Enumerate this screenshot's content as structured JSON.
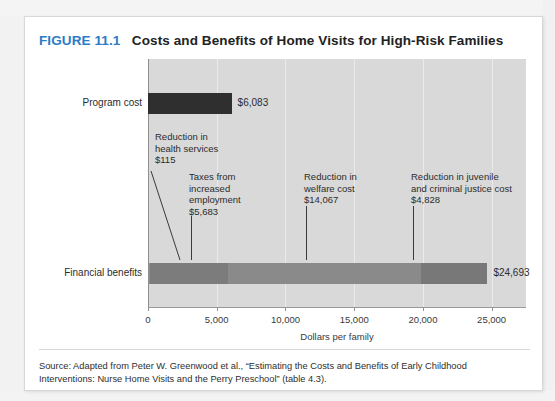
{
  "figure": {
    "number_label": "FIGURE 11.1",
    "title": "Costs and Benefits of Home Visits for High-Risk Families",
    "number_color": "#2b7cc4",
    "title_color": "#222222"
  },
  "source_note": "Source: Adapted from Peter W. Greenwood et al., “Estimating the Costs and Benefits of Early Childhood Interventions: Nurse Home Visits and the Perry Preschool” (table 4.3).",
  "chart_data": {
    "type": "bar",
    "orientation": "horizontal",
    "stacked": true,
    "title": "Costs and Benefits of Home Visits for High-Risk Families",
    "xlabel": "Dollars per family",
    "ylabel": "",
    "xlim": [
      0,
      27500
    ],
    "xticks": [
      0,
      5000,
      10000,
      15000,
      20000,
      25000
    ],
    "xtick_labels": [
      "0",
      "5,000",
      "10,000",
      "15,000",
      "20,000",
      "25,000"
    ],
    "grid": true,
    "legend": false,
    "categories": [
      "Program cost",
      "Financial benefits"
    ],
    "bars": [
      {
        "category": "Program cost",
        "total": 6083,
        "total_label": "$6,083",
        "segments": [
          {
            "name": "Program cost",
            "value": 6083,
            "color": "#2f2f2f"
          }
        ]
      },
      {
        "category": "Financial benefits",
        "total": 24693,
        "total_label": "$24,693",
        "segments": [
          {
            "name": "Reduction in health services",
            "value": 115,
            "color": "#8e8e8e"
          },
          {
            "name": "Taxes from increased employment",
            "value": 5683,
            "color": "#7c7c7c"
          },
          {
            "name": "Reduction in welfare cost",
            "value": 14067,
            "color": "#8a8a8a"
          },
          {
            "name": "Reduction in juvenile and criminal justice cost",
            "value": 4828,
            "color": "#787878"
          }
        ]
      }
    ],
    "annotations": [
      {
        "text": "Reduction in\nhealth services\n$115",
        "value_label": "$115",
        "points_to": 115
      },
      {
        "text": "Taxes from\nincreased\nemployment\n$5,683",
        "value_label": "$5,683",
        "points_to": 2900
      },
      {
        "text": "Reduction in\nwelfare cost\n$14,067",
        "value_label": "$14,067",
        "points_to": 12700
      },
      {
        "text": "Reduction in juvenile\nand criminal justice cost\n$4,828",
        "value_label": "$4,828",
        "points_to": 21500
      }
    ]
  },
  "axis": {
    "tick_labels": [
      "0",
      "5,000",
      "10,000",
      "15,000",
      "20,000",
      "25,000"
    ],
    "x_title": "Dollars per family"
  },
  "labels": {
    "program_cost": "Program cost",
    "financial_benefits": "Financial benefits",
    "program_cost_value": "$6,083",
    "financial_benefits_value": "$24,693"
  },
  "annotation_texts": {
    "health_services": "Reduction in\nhealth services\n$115",
    "taxes": "Taxes from\nincreased\nemployment\n$5,683",
    "welfare": "Reduction in\nwelfare cost\n$14,067",
    "justice": "Reduction in juvenile\nand criminal justice cost\n$4,828"
  }
}
